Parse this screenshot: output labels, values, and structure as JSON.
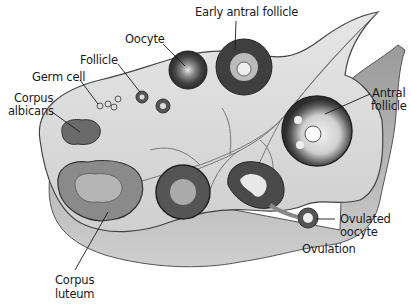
{
  "diagram": {
    "labels": {
      "early_antral_follicle": "Early antral follicle",
      "oocyte": "Oocyte",
      "follicle": "Follicle",
      "germ_cell": "Germ cell",
      "corpus_albicans_1": "Corpus",
      "corpus_albicans_2": "albicans",
      "antral_follicle_1": "Antral",
      "antral_follicle_2": "follicle",
      "corpus_luteum_1": "Corpus",
      "corpus_luteum_2": "luteum",
      "ovulated_oocyte_1": "Ovulated",
      "ovulated_oocyte_2": "oocyte",
      "ovulation": "Ovulation"
    },
    "colors": {
      "tissue_light": "#d9d9d9",
      "tissue_mid": "#a8a8a8",
      "tissue_dark": "#555555",
      "follicle_dark": "#3a3a3a",
      "label_text": "#1a1a1a"
    }
  }
}
